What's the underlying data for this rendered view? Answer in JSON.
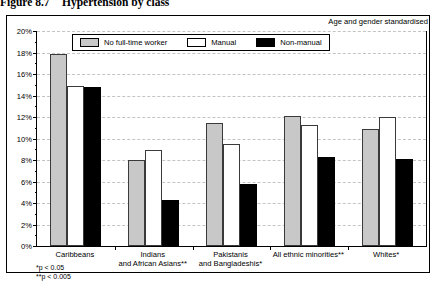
{
  "figure": {
    "number": "Figure 8.7",
    "title": "Hypertension by class",
    "note": "Age and gender standardised"
  },
  "footnotes": {
    "single_star": "*p < 0.05",
    "double_star": "**p < 0.005"
  },
  "colors": {
    "no_full_time_worker": "#c8c8c8",
    "manual": "#ffffff",
    "non_manual": "#000000",
    "axis": "#000000",
    "gridline": "#c4c4c4"
  },
  "chart_data": {
    "type": "bar",
    "title": "Hypertension by class",
    "subtitle": "Age and gender standardised",
    "xlabel": "",
    "ylabel": "",
    "ylim": [
      0,
      20
    ],
    "ytick_interval": 2,
    "yminor_interval": 1,
    "grid": true,
    "legend_position": "top-center",
    "value_suffix": "%",
    "categories": [
      "Caribbeans",
      "Indians and African Asians**",
      "Pakistanis and Bangladeshis*",
      "All ethnic minorities**",
      "Whites*"
    ],
    "tick_labels": [
      "0%",
      "2%",
      "4%",
      "6%",
      "8%",
      "10%",
      "12%",
      "14%",
      "16%",
      "18%",
      "20%"
    ],
    "series": [
      {
        "name": "No full-time worker",
        "values": [
          17.9,
          8.0,
          11.4,
          12.1,
          10.9
        ]
      },
      {
        "name": "Manual",
        "values": [
          14.9,
          8.9,
          9.5,
          11.3,
          12.0
        ]
      },
      {
        "name": "Non-manual",
        "values": [
          14.8,
          4.3,
          5.8,
          8.3,
          8.1
        ]
      }
    ]
  }
}
